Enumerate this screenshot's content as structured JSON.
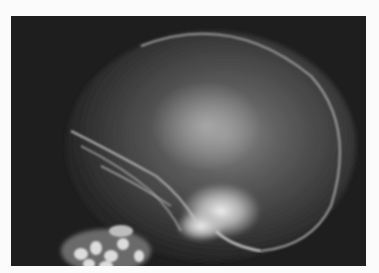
{
  "image": {
    "subject": "Lateral skull radiograph",
    "alt": "Lateral X-ray of a human skull",
    "background_color": "#fbfbfb",
    "panel_color": "#1e1e1e"
  }
}
